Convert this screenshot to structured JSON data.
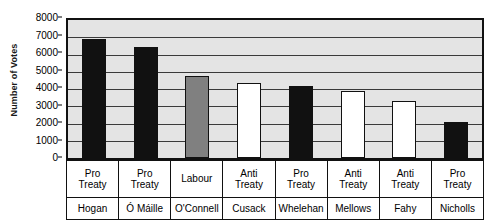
{
  "chart_data": {
    "type": "bar",
    "title": "",
    "xlabel": "",
    "ylabel": "Number of Votes",
    "ylim": [
      0,
      8000
    ],
    "ytick_step": 1000,
    "grid": true,
    "legend": false,
    "categories": [
      "Hogan",
      "Ó Máille",
      "O'Connell",
      "Cusack",
      "Whelehan",
      "Mellows",
      "Fahy",
      "Nicholls"
    ],
    "values": [
      6900,
      6450,
      4750,
      4350,
      4180,
      3880,
      3320,
      2080
    ],
    "ytick_labels": [
      "8000",
      "7000",
      "6000",
      "5000",
      "4000",
      "3000",
      "2000",
      "1000",
      "0"
    ],
    "ytick_values": [
      8000,
      7000,
      6000,
      5000,
      4000,
      3000,
      2000,
      1000,
      0
    ],
    "bars": [
      {
        "name": "Hogan",
        "party": "Pro Treaty",
        "party_line1": "Pro",
        "party_line2": "Treaty",
        "value": 6900,
        "color": "#111111"
      },
      {
        "name": "Ó Máille",
        "party": "Pro Treaty",
        "party_line1": "Pro",
        "party_line2": "Treaty",
        "value": 6450,
        "color": "#111111"
      },
      {
        "name": "O'Connell",
        "party": "Labour",
        "party_line1": "Labour",
        "party_line2": "",
        "value": 4750,
        "color": "#808080"
      },
      {
        "name": "Cusack",
        "party": "Anti Treaty",
        "party_line1": "Anti",
        "party_line2": "Treaty",
        "value": 4350,
        "color": "#ffffff"
      },
      {
        "name": "Whelehan",
        "party": "Pro Treaty",
        "party_line1": "Pro",
        "party_line2": "Treaty",
        "value": 4180,
        "color": "#111111"
      },
      {
        "name": "Mellows",
        "party": "Anti Treaty",
        "party_line1": "Anti",
        "party_line2": "Treaty",
        "value": 3880,
        "color": "#ffffff"
      },
      {
        "name": "Fahy",
        "party": "Anti Treaty",
        "party_line1": "Anti",
        "party_line2": "Treaty",
        "value": 3320,
        "color": "#ffffff"
      },
      {
        "name": "Nicholls",
        "party": "Pro Treaty",
        "party_line1": "Pro",
        "party_line2": "Treaty",
        "value": 2080,
        "color": "#111111"
      }
    ],
    "colors": {
      "pro_treaty": "#111111",
      "anti_treaty": "#ffffff",
      "labour": "#808080",
      "plot_background": "#e4e4e4",
      "gridline": "#3a3a3a",
      "frame": "#111111"
    }
  }
}
